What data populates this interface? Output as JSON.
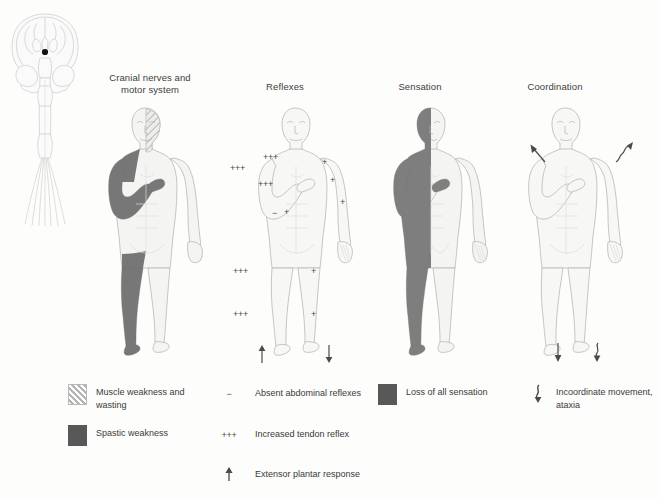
{
  "figure_title": "",
  "panels": [
    {
      "id": "cranial",
      "title_line1": "Cranial nerves and",
      "title_line2": "motor system",
      "marks": []
    },
    {
      "id": "reflexes",
      "title_line1": "Reflexes",
      "title_line2": "",
      "marks": [
        {
          "label": "+++",
          "note": "biceps reflex left (chest)"
        },
        {
          "label": "+",
          "note": "biceps reflex right (shoulder)"
        },
        {
          "label": "+++",
          "note": "brachioradialis left outer arm"
        },
        {
          "label": "+++",
          "note": "supinator reflex left forearm"
        },
        {
          "label": "+",
          "note": "triceps reflex right arm"
        },
        {
          "label": "+",
          "note": "wrist reflex right forearm"
        },
        {
          "label": "−",
          "note": "absent abdominal reflex left"
        },
        {
          "label": "+",
          "note": "abdominal reflex right"
        },
        {
          "label": "+++",
          "note": "knee reflex left"
        },
        {
          "label": "+",
          "note": "knee reflex right"
        },
        {
          "label": "+++",
          "note": "ankle reflex left"
        },
        {
          "label": "+",
          "note": "ankle reflex right"
        },
        {
          "label": "↑",
          "note": "extensor plantar response left"
        },
        {
          "label": "↓",
          "note": "normal plantar response right"
        }
      ]
    },
    {
      "id": "sensation",
      "title_line1": "Sensation",
      "title_line2": "",
      "marks": []
    },
    {
      "id": "coordination",
      "title_line1": "Coordination",
      "title_line2": "",
      "marks": [
        {
          "label": "↖",
          "note": "straight arrow left shoulder"
        },
        {
          "label": "↗",
          "note": "wavy ataxic arrow right shoulder"
        },
        {
          "label": "↓",
          "note": "straight arrow left foot"
        },
        {
          "label": "↓",
          "note": "wavy ataxic arrow right foot"
        }
      ]
    }
  ],
  "legend": {
    "items": [
      {
        "symbol_type": "hatch-swatch",
        "symbol": "",
        "text_line1": "Muscle weakness and",
        "text_line2": "wasting"
      },
      {
        "symbol_type": "solid-swatch",
        "symbol": "",
        "text_line1": "Spastic weakness",
        "text_line2": ""
      },
      {
        "symbol_type": "text",
        "symbol": "−",
        "text_line1": "Absent abdominal reflexes",
        "text_line2": ""
      },
      {
        "symbol_type": "text",
        "symbol": "+++",
        "text_line1": "Increased tendon reflex",
        "text_line2": ""
      },
      {
        "symbol_type": "up-arrow",
        "symbol": "↑",
        "text_line1": "Extensor plantar response",
        "text_line2": ""
      },
      {
        "symbol_type": "solid-swatch",
        "symbol": "",
        "text_line1": "Loss of all sensation",
        "text_line2": ""
      },
      {
        "symbol_type": "squiggle-arrow",
        "symbol": "↓",
        "text_line1": "Incoordinate movement,",
        "text_line2": "ataxia"
      }
    ]
  },
  "colors": {
    "background": "#fdfdfc",
    "body_fill": "#f4f4f2",
    "body_outline": "#b7b7b5",
    "shade_dark": "#6d6d6d",
    "shade_sensation": "#767676",
    "swatch_solid": "#585858",
    "text": "#3a3a3a",
    "lesion_dot": "#111111",
    "brain_outline": "#cfcfcf"
  }
}
